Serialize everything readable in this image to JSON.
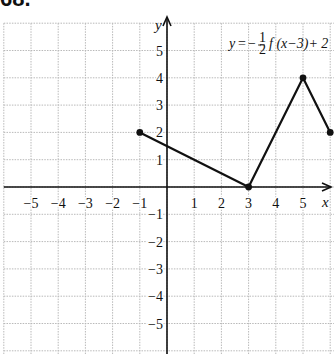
{
  "problem": {
    "number": "68."
  },
  "chart_data": {
    "type": "line",
    "label_parts": {
      "lhs": "y",
      "eq": "=",
      "minus": "−",
      "num": "1",
      "den": "2",
      "rhs": "f (x−3)+ 2"
    },
    "xlabel": "x",
    "ylabel": "y",
    "xlim": [
      -6,
      6
    ],
    "ylim": [
      -6,
      6
    ],
    "grid": true,
    "x_ticks": [
      "−5",
      "−4",
      "−3",
      "−2",
      "−1",
      "1",
      "2",
      "3",
      "4",
      "5"
    ],
    "x_tick_values": [
      -5,
      -4,
      -3,
      -2,
      -1,
      1,
      2,
      3,
      4,
      5
    ],
    "y_ticks": [
      "5",
      "4",
      "3",
      "2",
      "1",
      "−1",
      "−2",
      "−3",
      "−4",
      "−5"
    ],
    "y_tick_values": [
      5,
      4,
      3,
      2,
      1,
      -1,
      -2,
      -3,
      -4,
      -5
    ],
    "series": [
      {
        "name": "y = -1/2 f(x-3) + 2",
        "x": [
          -1,
          3,
          5,
          6
        ],
        "y": [
          2,
          0,
          4,
          2
        ],
        "markers": true
      }
    ]
  }
}
